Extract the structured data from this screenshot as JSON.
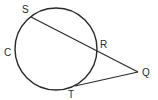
{
  "diagram": {
    "type": "circle-secant-tangent",
    "circle": {
      "label": "C",
      "cx": 56,
      "cy": 49,
      "r": 41
    },
    "points": {
      "S": {
        "label": "S",
        "x": 31,
        "y": 17,
        "label_x": 22,
        "label_y": 13
      },
      "R": {
        "label": "R",
        "x": 97,
        "y": 51,
        "label_x": 100,
        "label_y": 48
      },
      "Q": {
        "label": "Q",
        "x": 138,
        "y": 72,
        "label_x": 142,
        "label_y": 76
      },
      "T": {
        "label": "T",
        "x": 75,
        "y": 86,
        "label_x": 68,
        "label_y": 98
      }
    },
    "segments": [
      {
        "name": "secant-QS",
        "from": "Q",
        "to": "S"
      },
      {
        "name": "tangent-QT",
        "from": "Q",
        "to": "T"
      }
    ],
    "circle_label_pos": {
      "x": 4,
      "y": 56
    },
    "stroke_color": "#2a2a2a"
  }
}
